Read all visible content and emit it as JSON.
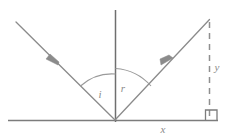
{
  "figure": {
    "canvas": {
      "width": 232,
      "height": 139,
      "background": "#ffffff"
    },
    "stroke_color": "#808080",
    "label_color": "#8a8a8a",
    "labels": {
      "angle_incidence": "i",
      "angle_reflection": "r",
      "vertical_distance": "y",
      "horizontal_distance": "x"
    },
    "elements": {
      "baseline": {
        "name": "surface-line",
        "x1": 8,
        "y1": 120,
        "x2": 218,
        "y2": 120
      },
      "normal": {
        "name": "normal-line",
        "x1": 115,
        "y1": 10,
        "x2": 115,
        "y2": 122
      },
      "incident_ray": {
        "name": "incident-ray",
        "x1": 16,
        "y1": 22,
        "x2": 115,
        "y2": 120,
        "arrow_at": [
          52,
          59
        ],
        "arrow_direction": "down-right"
      },
      "reflected_ray": {
        "name": "reflected-ray",
        "x1": 115,
        "y1": 120,
        "x2": 209,
        "y2": 20,
        "arrow_at": [
          168,
          63
        ],
        "arrow_direction": "up-right"
      },
      "dashed_vertical": {
        "name": "dashed-height-line",
        "x1": 209,
        "y1": 22,
        "x2": 209,
        "y2": 118,
        "style": "dashed"
      },
      "right_angle_marker": {
        "name": "right-angle-square",
        "x": 205,
        "y": 110,
        "size": 11
      },
      "arc_incidence": {
        "name": "angle-arc-i",
        "radius": 46
      },
      "arc_reflection": {
        "name": "angle-arc-r",
        "radius": 52
      }
    },
    "label_positions": {
      "i": {
        "x": 100,
        "y": 94
      },
      "r": {
        "x": 123,
        "y": 88
      },
      "y": {
        "x": 217,
        "y": 67
      },
      "x": {
        "x": 163,
        "y": 128
      }
    }
  }
}
